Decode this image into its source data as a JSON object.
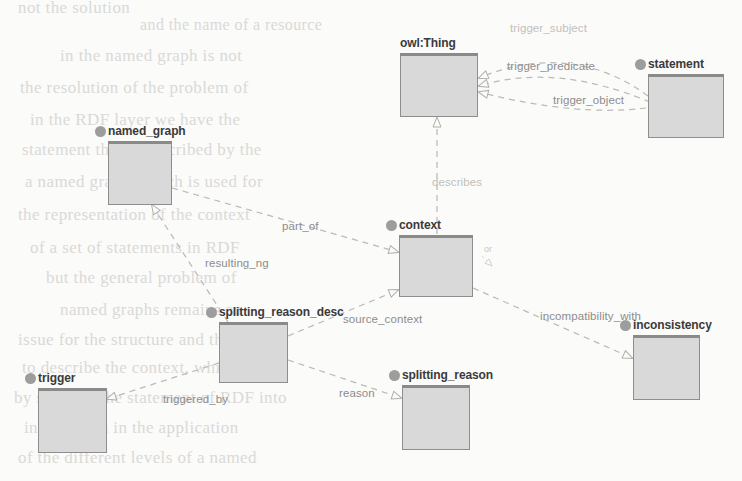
{
  "diagram": {
    "type": "uml-class-diagram",
    "canvas": {
      "width": 742,
      "height": 481
    },
    "style": {
      "node_fill": "#d9d9d9",
      "node_border": "#8e8e8e",
      "bullet_color": "#9d9d9d",
      "edge_color": "#b9b7b3",
      "label_color": "#8d8d8d",
      "background": "#fbfbfa"
    },
    "nodes": [
      {
        "id": "owl_thing",
        "label": "owl:Thing",
        "x": 400,
        "y": 53,
        "w": 78,
        "h": 64
      },
      {
        "id": "statement",
        "label": "statement",
        "x": 648,
        "y": 74,
        "w": 76,
        "h": 64
      },
      {
        "id": "named_graph",
        "label": "named_graph",
        "x": 108,
        "y": 141,
        "w": 64,
        "h": 64
      },
      {
        "id": "context",
        "label": "context",
        "x": 399,
        "y": 235,
        "w": 74,
        "h": 62
      },
      {
        "id": "splitting_reason_desc",
        "label": "splitting_reason_desc",
        "x": 219,
        "y": 322,
        "w": 69,
        "h": 61
      },
      {
        "id": "inconsistency",
        "label": "inconsistency",
        "x": 633,
        "y": 335,
        "w": 67,
        "h": 65
      },
      {
        "id": "trigger",
        "label": "trigger",
        "x": 38,
        "y": 388,
        "w": 69,
        "h": 65
      },
      {
        "id": "splitting_reason",
        "label": "splitting_reason",
        "x": 402,
        "y": 385,
        "w": 68,
        "h": 65
      }
    ],
    "edges": [
      {
        "id": "trigger_subject",
        "label": "trigger_subject",
        "from": "statement",
        "to": "owl_thing",
        "label_x": 510,
        "label_y": 22,
        "faint": true
      },
      {
        "id": "trigger_predicate",
        "label": "trigger_predicate",
        "from": "statement",
        "to": "owl_thing",
        "label_x": 507,
        "label_y": 60,
        "faint": false
      },
      {
        "id": "trigger_object",
        "label": "trigger_object",
        "from": "statement",
        "to": "owl_thing",
        "label_x": 553,
        "label_y": 94,
        "faint": false
      },
      {
        "id": "describes",
        "label": "describes",
        "from": "context",
        "to": "owl_thing",
        "label_x": 432,
        "label_y": 176,
        "faint": true
      },
      {
        "id": "part_of",
        "label": "part_of",
        "from": "named_graph",
        "to": "context",
        "label_x": 282,
        "label_y": 220,
        "faint": false
      },
      {
        "id": "resulting_ng",
        "label": "resulting_ng",
        "from": "splitting_reason_desc",
        "to": "named_graph",
        "label_x": 205,
        "label_y": 257,
        "faint": false
      },
      {
        "id": "source_context",
        "label": "source_context",
        "from": "splitting_reason_desc",
        "to": "context",
        "label_x": 343,
        "label_y": 313,
        "faint": false
      },
      {
        "id": "incompatibility_with",
        "label": "incompatibility_with",
        "from": "context",
        "to": "inconsistency",
        "label_x": 540,
        "label_y": 310,
        "faint": false
      },
      {
        "id": "triggered_by",
        "label": "triggered_by",
        "from": "splitting_reason_desc",
        "to": "trigger",
        "label_x": 163,
        "label_y": 393,
        "faint": false
      },
      {
        "id": "reason",
        "label": "reason",
        "from": "splitting_reason_desc",
        "to": "splitting_reason",
        "label_x": 339,
        "label_y": 387,
        "faint": false
      },
      {
        "id": "or_marker",
        "label": "or",
        "from": "context",
        "to": "context",
        "label_x": 484,
        "label_y": 244,
        "faint": true
      }
    ],
    "ghost_text": [
      {
        "text": "not the solution",
        "x": 18,
        "y": -2,
        "size": 17
      },
      {
        "text": "and the name of a resource",
        "x": 140,
        "y": 16,
        "size": 16
      },
      {
        "text": "in the named graph is not",
        "x": 60,
        "y": 46,
        "size": 17
      },
      {
        "text": "the resolution of the problem of",
        "x": 20,
        "y": 78,
        "size": 17
      },
      {
        "text": "in the RDF layer we have the",
        "x": 30,
        "y": 110,
        "size": 17
      },
      {
        "text": "statement that is described by the",
        "x": 22,
        "y": 140,
        "size": 17
      },
      {
        "text": "a named graph, which is used for",
        "x": 25,
        "y": 172,
        "size": 17
      },
      {
        "text": "the representation of the context",
        "x": 18,
        "y": 205,
        "size": 17
      },
      {
        "text": "of a set of statements in RDF",
        "x": 30,
        "y": 238,
        "size": 17
      },
      {
        "text": "but the general problem of",
        "x": 46,
        "y": 268,
        "size": 17
      },
      {
        "text": "named graphs remains an",
        "x": 60,
        "y": 300,
        "size": 17
      },
      {
        "text": "issue for the structure and the",
        "x": 18,
        "y": 330,
        "size": 17
      },
      {
        "text": "to describe the context, which",
        "x": 22,
        "y": 358,
        "size": 17
      },
      {
        "text": "by splitting the statement of RDF into",
        "x": 14,
        "y": 388,
        "size": 17
      },
      {
        "text": "information in the application",
        "x": 24,
        "y": 418,
        "size": 17
      },
      {
        "text": "of the different levels of a named",
        "x": 18,
        "y": 448,
        "size": 17
      }
    ]
  }
}
